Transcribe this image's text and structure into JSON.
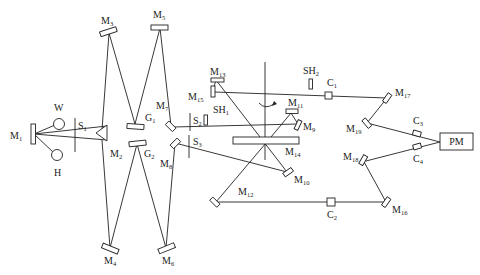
{
  "diagram": {
    "type": "optical-setup-schematic",
    "labels": {
      "M1": {
        "base": "M",
        "sub": "1"
      },
      "M2": {
        "base": "M",
        "sub": "2"
      },
      "M3": {
        "base": "M",
        "sub": "3"
      },
      "M4": {
        "base": "M",
        "sub": "4"
      },
      "M5": {
        "base": "M",
        "sub": "5"
      },
      "M6": {
        "base": "M",
        "sub": "6"
      },
      "M7": {
        "base": "M",
        "sub": "7"
      },
      "M8": {
        "base": "M",
        "sub": "8"
      },
      "M9": {
        "base": "M",
        "sub": "9"
      },
      "M10": {
        "base": "M",
        "sub": "10"
      },
      "M11": {
        "base": "M",
        "sub": "11"
      },
      "M12": {
        "base": "M",
        "sub": "12"
      },
      "M13": {
        "base": "M",
        "sub": "13"
      },
      "M14": {
        "base": "M",
        "sub": "14"
      },
      "M15": {
        "base": "M",
        "sub": "15"
      },
      "M16": {
        "base": "M",
        "sub": "16"
      },
      "M17": {
        "base": "M",
        "sub": "17"
      },
      "M18": {
        "base": "M",
        "sub": "18"
      },
      "M19": {
        "base": "M",
        "sub": "19"
      },
      "G1": {
        "base": "G",
        "sub": "1"
      },
      "G2": {
        "base": "G",
        "sub": "2"
      },
      "S1": {
        "base": "S",
        "sub": "1"
      },
      "S2": {
        "base": "S",
        "sub": "2"
      },
      "S3": {
        "base": "S",
        "sub": "3"
      },
      "SH1": {
        "base": "SH",
        "sub": "1"
      },
      "SH2": {
        "base": "SH",
        "sub": "2"
      },
      "C1": {
        "base": "C",
        "sub": "1"
      },
      "C2": {
        "base": "C",
        "sub": "2"
      },
      "C3": {
        "base": "C",
        "sub": "3"
      },
      "C4": {
        "base": "C",
        "sub": "4"
      },
      "W": {
        "base": "W",
        "sub": ""
      },
      "H": {
        "base": "H",
        "sub": ""
      },
      "PM": "PM"
    }
  }
}
